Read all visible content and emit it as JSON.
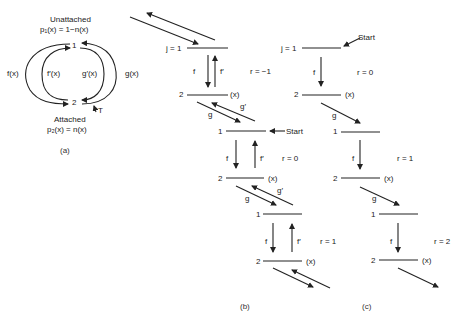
{
  "panel_a": {
    "unattached_label": "Unattached",
    "p1_eq": "p₁(x) = 1−n(x)",
    "state1": "1",
    "state2": "2",
    "f_label": "f(x)",
    "fprime_label": "f′(x)",
    "gprime_label": "g′(x)",
    "g_label": "g(x)",
    "T_label": "T",
    "attached_label": "Attached",
    "p2_eq": "p₂(x) = n(x)",
    "caption": "(a)"
  },
  "panel_b": {
    "caption": "(b)",
    "levels": [
      {
        "j1": "j = 1",
        "j2": "2",
        "x": "(x)",
        "f": "f",
        "fp": "f′",
        "r": "r = −1"
      },
      {
        "j1": "1",
        "j2": "2",
        "x": "(x)",
        "f": "f",
        "fp": "f′",
        "r": "r = 0",
        "start": "Start"
      },
      {
        "j1": "1",
        "j2": "2",
        "x": "(x)",
        "f": "f",
        "fp": "f′",
        "r": "r = 1"
      }
    ],
    "g": "g",
    "gp": "g′"
  },
  "panel_c": {
    "caption": "(c)",
    "start": "Start",
    "levels": [
      {
        "j1": "j = 1",
        "j2": "2",
        "x": "(x)",
        "f": "f",
        "r": "r = 0"
      },
      {
        "j1": "1",
        "j2": "2",
        "x": "(x)",
        "f": "f",
        "r": "r = 1"
      },
      {
        "j1": "1",
        "j2": "2",
        "x": "(x)",
        "f": "f",
        "r": "r = 2"
      }
    ],
    "g": "g"
  }
}
